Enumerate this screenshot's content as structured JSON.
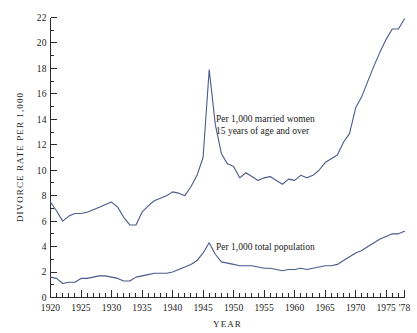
{
  "chart_data": {
    "type": "line",
    "title": "",
    "xlabel": "YEAR",
    "ylabel": "DIVORCE RATE PER 1,000",
    "xlim": [
      1920,
      1978
    ],
    "ylim": [
      0,
      22
    ],
    "grid": false,
    "legend_position": "inline-annotations",
    "y_ticks_major": [
      0,
      2,
      4,
      6,
      8,
      10,
      12,
      14,
      16,
      18,
      20,
      22
    ],
    "y_tick_labels": [
      "0",
      "2",
      "4",
      "6",
      "8",
      "10",
      "12",
      "14",
      "16",
      "18",
      "20",
      "22"
    ],
    "y_ticks_minor_step": 1,
    "x_ticks_major": [
      1920,
      1925,
      1930,
      1935,
      1940,
      1945,
      1950,
      1955,
      1960,
      1965,
      1970,
      1975,
      1978
    ],
    "x_tick_labels": [
      "1920",
      "1925",
      "1930",
      "1935",
      "1940",
      "1945",
      "1950",
      "1955",
      "1960",
      "1965",
      "1970",
      "1975",
      "'78"
    ],
    "x_ticks_minor_step": 1,
    "line_color": "#4a5a8a",
    "axis_color": "#2a2a2a",
    "x": [
      1920,
      1921,
      1922,
      1923,
      1924,
      1925,
      1926,
      1927,
      1928,
      1929,
      1930,
      1931,
      1932,
      1933,
      1934,
      1935,
      1936,
      1937,
      1938,
      1939,
      1940,
      1941,
      1942,
      1943,
      1944,
      1945,
      1946,
      1947,
      1948,
      1949,
      1950,
      1951,
      1952,
      1953,
      1954,
      1955,
      1956,
      1957,
      1958,
      1959,
      1960,
      1961,
      1962,
      1963,
      1964,
      1965,
      1966,
      1967,
      1968,
      1969,
      1970,
      1971,
      1972,
      1973,
      1974,
      1975,
      1976,
      1977,
      1978
    ],
    "series": [
      {
        "name": "Per 1,000 married women 15 years of age and over",
        "annotation_line_1": "Per 1,000 married women",
        "annotation_line_2": "15 years of age and over",
        "values": [
          7.5,
          6.8,
          6.0,
          6.4,
          6.6,
          6.6,
          6.7,
          6.9,
          7.1,
          7.3,
          7.5,
          7.1,
          6.3,
          5.7,
          5.7,
          6.7,
          7.2,
          7.6,
          7.8,
          8.0,
          8.3,
          8.2,
          8.0,
          8.7,
          9.6,
          11.0,
          17.9,
          13.6,
          11.3,
          10.5,
          10.3,
          9.4,
          9.8,
          9.5,
          9.2,
          9.4,
          9.5,
          9.2,
          8.9,
          9.3,
          9.2,
          9.6,
          9.4,
          9.6,
          10.0,
          10.6,
          10.9,
          11.2,
          12.2,
          12.9,
          14.9,
          15.8,
          17.0,
          18.2,
          19.3,
          20.3,
          21.1,
          21.1,
          21.9
        ]
      },
      {
        "name": "Per 1,000 total population",
        "annotation_line_1": "Per 1,000 total population",
        "values": [
          1.6,
          1.5,
          1.1,
          1.2,
          1.2,
          1.5,
          1.5,
          1.6,
          1.7,
          1.7,
          1.6,
          1.5,
          1.3,
          1.3,
          1.6,
          1.7,
          1.8,
          1.9,
          1.9,
          1.9,
          2.0,
          2.2,
          2.4,
          2.6,
          2.9,
          3.5,
          4.3,
          3.4,
          2.8,
          2.7,
          2.6,
          2.5,
          2.5,
          2.5,
          2.4,
          2.3,
          2.3,
          2.2,
          2.1,
          2.2,
          2.2,
          2.3,
          2.2,
          2.3,
          2.4,
          2.5,
          2.5,
          2.6,
          2.9,
          3.2,
          3.5,
          3.7,
          4.0,
          4.3,
          4.6,
          4.8,
          5.0,
          5.0,
          5.2
        ]
      }
    ]
  }
}
